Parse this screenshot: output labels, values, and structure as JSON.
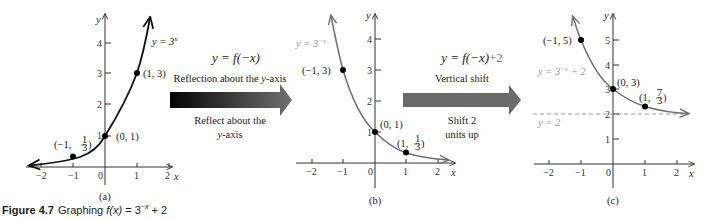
{
  "caption": {
    "figure_number": "Figure 4.7",
    "text": "Graphing f(x) = 3^-x + 2",
    "prefix": "Graphing ",
    "func": "f(x)",
    "eq": " = 3",
    "exp": "−x",
    "tail": " + 2"
  },
  "panels": [
    {
      "id": "a",
      "label": "(a)",
      "curve_label": "y = 3",
      "curve_exp": "x",
      "axis_x": "x",
      "axis_y": "y",
      "x_ticks": [
        "−2",
        "−1",
        "0",
        "1",
        "2"
      ],
      "y_ticks": [
        "1",
        "2",
        "3",
        "4"
      ],
      "points": [
        {
          "label": "(−1, ",
          "frac_n": "1",
          "frac_d": "3",
          "x": -1,
          "y": 0.333
        },
        {
          "label": "(0, 1)",
          "x": 0,
          "y": 1
        },
        {
          "label": "(1, 3)",
          "x": 1,
          "y": 3
        }
      ]
    },
    {
      "id": "b",
      "label": "(b)",
      "curve_label": "y = 3",
      "curve_exp": "−x",
      "axis_x": "x",
      "axis_y": "y",
      "x_ticks": [
        "−2",
        "−1",
        "0",
        "1",
        "2"
      ],
      "y_ticks": [
        "1",
        "2",
        "3",
        "4"
      ],
      "points": [
        {
          "label": "(−1, 3)",
          "x": -1,
          "y": 3
        },
        {
          "label": "(0, 1)",
          "x": 0,
          "y": 1
        },
        {
          "label": "(1, ",
          "frac_n": "1",
          "frac_d": "3",
          "x": 1,
          "y": 0.333
        }
      ]
    },
    {
      "id": "c",
      "label": "(c)",
      "curve_label": "y = 3",
      "curve_exp": "−x",
      "curve_tail": " + 2",
      "asymptote_label": "y = 2",
      "axis_x": "x",
      "axis_y": "y",
      "x_ticks": [
        "−2",
        "−1",
        "0",
        "1",
        "2"
      ],
      "y_ticks": [
        "1",
        "2",
        "3",
        "4",
        "5"
      ],
      "points": [
        {
          "label": "(−1, 5)",
          "x": -1,
          "y": 5
        },
        {
          "label": "(0, 3)",
          "x": 0,
          "y": 3
        },
        {
          "label": "(1, ",
          "frac_n": "7",
          "frac_d": "3",
          "x": 1,
          "y": 2.333
        }
      ]
    }
  ],
  "transforms": [
    {
      "formula": "y = f(−x)",
      "title": "Reflection about the y-axis",
      "title_pre": "Reflection about the ",
      "title_var": "y",
      "title_post": "-axis",
      "desc_line1": "Reflect about the",
      "desc_line2_var": "y",
      "desc_line2_post": "-axis",
      "arrow_color_start": "#0a0a0a",
      "arrow_color_end": "#6e6e6e"
    },
    {
      "formula": "y = f(−x)",
      "formula_tail": "+2",
      "title": "Vertical shift",
      "desc_line1": "Shift 2",
      "desc_line2": "units up",
      "arrow_color_start": "#6a6a6a",
      "arrow_color_end": "#6a6a6a"
    }
  ],
  "colors": {
    "curve_a": "#111111",
    "curve_b": "#6f6f6f",
    "curve_c": "#6f6f6f",
    "asymptote": "#9a9a9a",
    "axis": "#333333",
    "point": "#000000"
  }
}
